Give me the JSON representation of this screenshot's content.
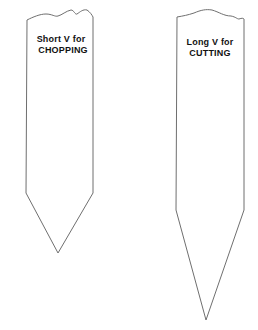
{
  "diagram": {
    "left_blade": {
      "label_line1": "Short V for",
      "label_line2": "CHOPPING"
    },
    "right_blade": {
      "label_line1": "Long V for",
      "label_line2": "CUTTING"
    },
    "colors": {
      "background": "#ffffff",
      "outline": "#6f6f6f",
      "text": "#111111"
    }
  }
}
